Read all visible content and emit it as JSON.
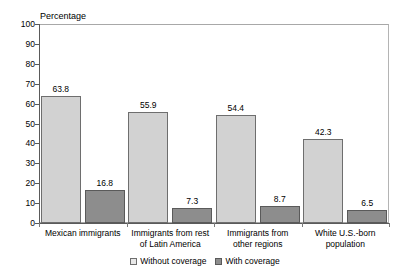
{
  "chart_data": {
    "type": "bar",
    "title": "",
    "ylabel": "Percentage",
    "xlabel": "",
    "ylim": [
      0,
      100
    ],
    "ytick_step": 10,
    "grid": false,
    "legend_position": "bottom-center",
    "categories": [
      "Mexican immigrants",
      "Immigrants from rest of Latin America",
      "Immigrants from other regions",
      "White U.S.-born population"
    ],
    "category_lines": [
      [
        "Mexican immigrants"
      ],
      [
        "Immigrants from rest",
        "of Latin America"
      ],
      [
        "Immigrants from",
        "other regions"
      ],
      [
        "White U.S.-born",
        "population"
      ]
    ],
    "yticks": [
      "0",
      "10",
      "20",
      "30",
      "40",
      "50",
      "60",
      "70",
      "80",
      "90",
      "100"
    ],
    "series": [
      {
        "name": "Without coverage",
        "color": "#d2d2d2",
        "values": [
          63.8,
          55.9,
          54.4,
          42.3
        ],
        "labels": [
          "63.8",
          "55.9",
          "54.4",
          "42.3"
        ]
      },
      {
        "name": "With coverage",
        "color": "#8d8d8d",
        "values": [
          16.8,
          7.3,
          8.7,
          6.5
        ],
        "labels": [
          "16.8",
          "7.3",
          "8.7",
          "6.5"
        ]
      }
    ]
  },
  "legend": {
    "items": [
      {
        "label": "Without coverage"
      },
      {
        "label": "With coverage"
      }
    ]
  }
}
